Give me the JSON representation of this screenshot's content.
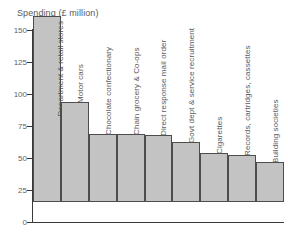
{
  "chart_data": {
    "type": "bar",
    "title": "Spending (£ million)",
    "xlabel": "",
    "ylabel": "Spending (£ million)",
    "ylim": [
      0,
      150
    ],
    "yticks": [
      0,
      25,
      50,
      75,
      100,
      125,
      150
    ],
    "ytick_labels": [
      "0",
      "25",
      "50",
      "75",
      "100",
      "125",
      "150"
    ],
    "grid": false,
    "legend": "none",
    "bar_color": "#c3c3c3",
    "bar_edge_color": "#4d4d4d",
    "axis_color": "#3a3a3a",
    "categories": [
      "Department & retail stores",
      "Motor cars",
      "Chocolate confectionary",
      "Chain grocery & Co-ops",
      "Direct response mail order",
      "Govt dept & service recruitment",
      "Cigarettes",
      "Records, cartridges, cassettes",
      "Building societies"
    ],
    "values": [
      145,
      78,
      53,
      53,
      52,
      47,
      38,
      37,
      31
    ]
  }
}
